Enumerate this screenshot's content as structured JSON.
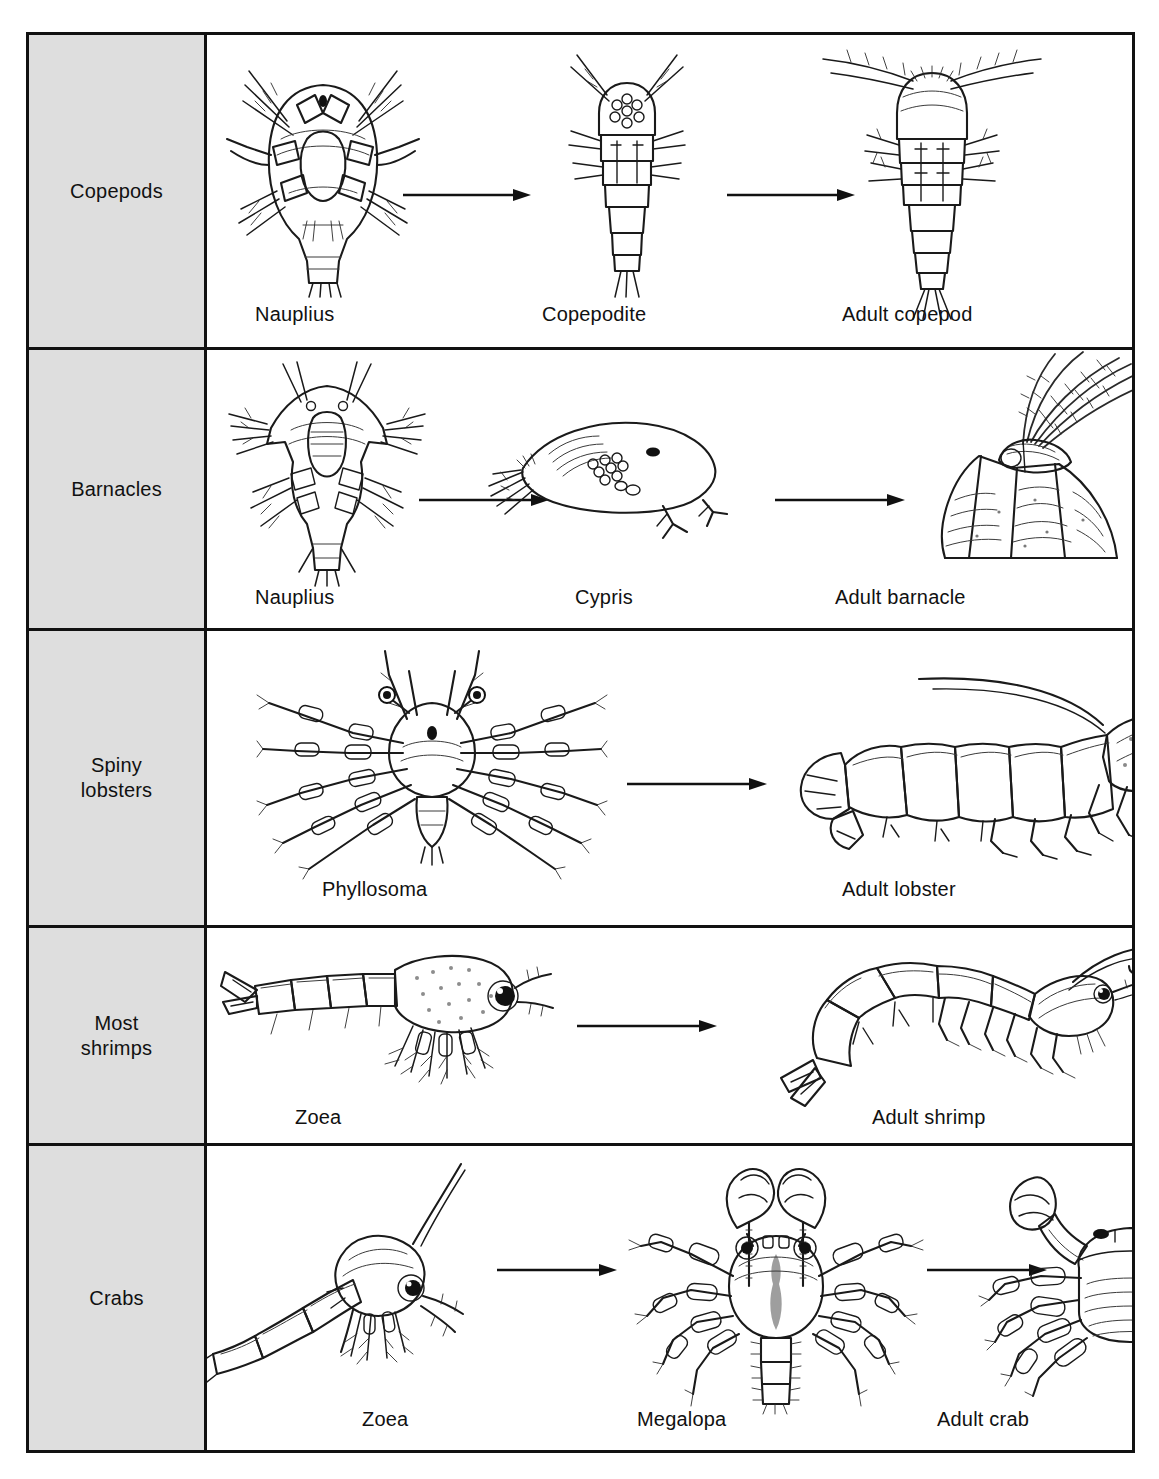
{
  "figure": {
    "border_color": "#111111",
    "label_cell_color": "#dedede",
    "background_color": "#ffffff",
    "text_color": "#111111"
  },
  "rows": [
    {
      "group_label": "Copepods",
      "group_label_lines": [
        "Copepods"
      ],
      "stages": [
        {
          "caption": "Nauplius",
          "art": "copepod-nauplius-illustration"
        },
        {
          "caption": "Copepodite",
          "art": "copepodite-illustration"
        },
        {
          "caption": "Adult copepod",
          "art": "adult-copepod-illustration"
        }
      ],
      "arrows": 2
    },
    {
      "group_label": "Barnacles",
      "group_label_lines": [
        "Barnacles"
      ],
      "stages": [
        {
          "caption": "Nauplius",
          "art": "barnacle-nauplius-illustration"
        },
        {
          "caption": "Cypris",
          "art": "cypris-illustration"
        },
        {
          "caption": "Adult barnacle",
          "art": "adult-barnacle-illustration"
        }
      ],
      "arrows": 2
    },
    {
      "group_label": "Spiny lobsters",
      "group_label_lines": [
        "Spiny",
        "lobsters"
      ],
      "stages": [
        {
          "caption": "Phyllosoma",
          "art": "phyllosoma-illustration"
        },
        {
          "caption": "Adult lobster",
          "art": "adult-lobster-illustration"
        }
      ],
      "arrows": 1
    },
    {
      "group_label": "Most shrimps",
      "group_label_lines": [
        "Most",
        "shrimps"
      ],
      "stages": [
        {
          "caption": "Zoea",
          "art": "shrimp-zoea-illustration"
        },
        {
          "caption": "Adult shrimp",
          "art": "adult-shrimp-illustration"
        }
      ],
      "arrows": 1
    },
    {
      "group_label": "Crabs",
      "group_label_lines": [
        "Crabs"
      ],
      "stages": [
        {
          "caption": "Zoea",
          "art": "crab-zoea-illustration"
        },
        {
          "caption": "Megalopa",
          "art": "megalopa-illustration"
        },
        {
          "caption": "Adult crab",
          "art": "adult-crab-illustration"
        }
      ],
      "arrows": 2
    }
  ]
}
